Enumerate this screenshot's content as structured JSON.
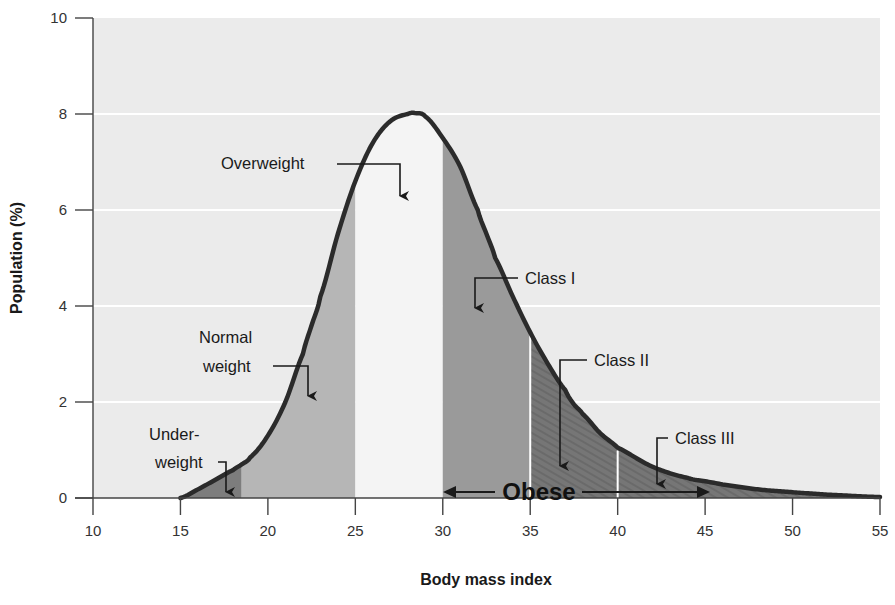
{
  "chart_data": {
    "type": "area",
    "title": "",
    "xlabel": "Body mass index",
    "ylabel": "Population (%)",
    "xlim": [
      10,
      55
    ],
    "ylim": [
      0,
      10
    ],
    "x_ticks": [
      10,
      15,
      20,
      25,
      30,
      35,
      40,
      45,
      50,
      55
    ],
    "y_ticks": [
      0,
      2,
      4,
      6,
      8,
      10
    ],
    "grid": {
      "horizontal": true,
      "vertical": false,
      "style": "white lines on light gray background"
    },
    "legend": null,
    "series": [
      {
        "name": "BMI distribution",
        "x": [
          15,
          16,
          17,
          18,
          18.5,
          19,
          20,
          21,
          22,
          22.5,
          23,
          24,
          25,
          26,
          27,
          28,
          28.4,
          29,
          30,
          31,
          32,
          32.5,
          33,
          34,
          35,
          36,
          37,
          37.5,
          38,
          39,
          40,
          42,
          44,
          45,
          46,
          48,
          50,
          52,
          55
        ],
        "values": [
          0,
          0.18,
          0.38,
          0.58,
          0.7,
          0.85,
          1.3,
          2.0,
          3.0,
          3.6,
          4.2,
          5.5,
          6.6,
          7.4,
          7.85,
          8.0,
          8.02,
          7.95,
          7.5,
          6.9,
          6.0,
          5.5,
          5.0,
          4.2,
          3.45,
          2.8,
          2.25,
          1.95,
          1.75,
          1.35,
          1.05,
          0.65,
          0.42,
          0.35,
          0.28,
          0.18,
          0.12,
          0.07,
          0.02
        ]
      }
    ],
    "regions": [
      {
        "name": "Underweight",
        "label": "Under-\nweight",
        "x_range": [
          15,
          18.5
        ],
        "fill": "#7d7d7d"
      },
      {
        "name": "Normal weight",
        "label": "Normal\nweight",
        "x_range": [
          18.5,
          25
        ],
        "fill": "#b6b6b6"
      },
      {
        "name": "Overweight",
        "label": "Overweight",
        "x_range": [
          25,
          30
        ],
        "fill": "#f4f4f4"
      },
      {
        "name": "Class I",
        "label": "Class I",
        "x_range": [
          30,
          35
        ],
        "fill": "#9a9a9a"
      },
      {
        "name": "Class II",
        "label": "Class II",
        "x_range": [
          35,
          40
        ],
        "fill": "#7a7a7a"
      },
      {
        "name": "Class III",
        "label": "Class III",
        "x_range": [
          40,
          55
        ],
        "fill": "#737373"
      }
    ],
    "annotations": [
      {
        "text": "Obese",
        "span": [
          30,
          45
        ],
        "style": "bold double-headed arrow along x-axis"
      }
    ],
    "curve_peak": {
      "x": 28.4,
      "y": 8.0
    }
  },
  "labels": {
    "x_axis_title": "Body mass index",
    "y_axis_title": "Population (%)",
    "overweight": "Overweight",
    "normal_line1": "Normal",
    "normal_line2": "weight",
    "under_line1": "Under-",
    "under_line2": "weight",
    "class1": "Class I",
    "class2": "Class II",
    "class3": "Class III",
    "obese": "Obese"
  },
  "colors": {
    "plot_background": "#ebebeb",
    "gridline": "#ffffff",
    "curve": "#2b2b2b",
    "axis": "#444444"
  }
}
